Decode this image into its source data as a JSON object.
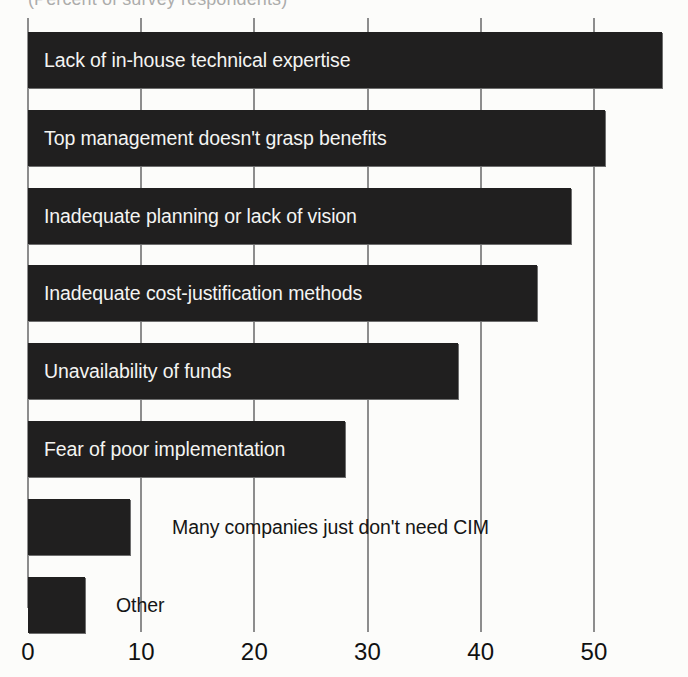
{
  "chart_data": {
    "type": "bar",
    "orientation": "horizontal",
    "title": "",
    "subtitle": "(Percent of survey respondents)",
    "xlabel": "",
    "ylabel": "",
    "xlim": [
      0,
      57
    ],
    "grid": true,
    "legend": "none",
    "xticks": [
      "0",
      "10",
      "20",
      "30",
      "40",
      "50"
    ],
    "xtick_values": [
      0,
      10,
      20,
      30,
      40,
      50
    ],
    "categories": [
      "Lack of in-house technical expertise",
      "Top management doesn't grasp benefits",
      "Inadequate planning or lack of vision",
      "Inadequate cost-justification methods",
      "Unavailability of funds",
      "Fear of poor implementation",
      "Many companies just don't need CIM",
      "Other"
    ],
    "values": [
      56,
      51,
      48,
      45,
      38,
      28,
      9,
      5
    ],
    "label_placement": [
      "inside",
      "inside",
      "inside",
      "inside",
      "inside",
      "inside",
      "outside",
      "outside"
    ],
    "bar_color": "#201f1f",
    "inside_label_color": "#f4f4f2",
    "outside_label_color": "#151515",
    "gridline_color": "#8d8d8d"
  },
  "axis": {
    "ticks": [
      {
        "label": "0",
        "value": 0
      },
      {
        "label": "10",
        "value": 10
      },
      {
        "label": "20",
        "value": 20
      },
      {
        "label": "30",
        "value": 30
      },
      {
        "label": "40",
        "value": 40
      },
      {
        "label": "50",
        "value": 50
      }
    ]
  }
}
